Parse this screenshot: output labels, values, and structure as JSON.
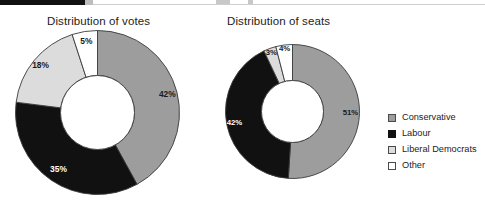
{
  "page": {
    "background": "#ffffff",
    "width": 485,
    "height": 214
  },
  "header_strip": {
    "visible": true,
    "note": "cropped dark header band at top edge"
  },
  "legend": {
    "position": "right",
    "items": [
      {
        "label": "Conservative",
        "color": "#9d9d9d",
        "border": "#4a4a4a"
      },
      {
        "label": "Labour",
        "color": "#111111",
        "border": "#111111"
      },
      {
        "label": "Liberal Democrats",
        "color": "#dcdcdc",
        "border": "#4a4a4a"
      },
      {
        "label": "Other",
        "color": "#ffffff",
        "border": "#4a4a4a"
      }
    ]
  },
  "chart_data": [
    {
      "type": "pie",
      "variant": "donut",
      "title": "Distribution of votes",
      "xlabel": "",
      "ylabel": "",
      "units": "percent",
      "start_angle_deg": 0,
      "direction": "clockwise",
      "categories": [
        "Conservative",
        "Labour",
        "Liberal Democrats",
        "Other"
      ],
      "values": [
        42,
        35,
        18,
        5
      ],
      "labels": [
        "42%",
        "35%",
        "18%",
        "5%"
      ],
      "colors": [
        "#9d9d9d",
        "#111111",
        "#dcdcdc",
        "#ffffff"
      ],
      "label_colors": [
        "#1a1a1a",
        "#ffffff",
        "#1a1a1a",
        "#1a1a1a"
      ],
      "geometry": {
        "cx": 83.5,
        "cy": 83.5,
        "r_outer": 82,
        "r_inner": 37
      },
      "label_radius_frac": [
        0.78,
        0.72,
        0.82,
        0.76
      ],
      "label_font_px": 8.4,
      "legend_position": "right",
      "grid": false
    },
    {
      "type": "pie",
      "variant": "donut",
      "title": "Distribution of seats",
      "xlabel": "",
      "ylabel": "",
      "units": "percent",
      "start_angle_deg": 0,
      "direction": "clockwise",
      "categories": [
        "Conservative",
        "Labour",
        "Liberal Democrats",
        "Other"
      ],
      "values": [
        51,
        42,
        3,
        4
      ],
      "labels": [
        "51%",
        "42%",
        "3%",
        "4%"
      ],
      "colors": [
        "#9d9d9d",
        "#111111",
        "#dcdcdc",
        "#ffffff"
      ],
      "label_colors": [
        "#1a1a1a",
        "#ffffff",
        "#1a1a1a",
        "#1a1a1a"
      ],
      "geometry": {
        "cx": 68.5,
        "cy": 68.5,
        "r_outer": 67,
        "r_inner": 31
      },
      "label_radius_frac": [
        0.75,
        0.78,
        0.88,
        0.88
      ],
      "label_font_px": 7.8,
      "legend_position": "right",
      "grid": false
    }
  ]
}
